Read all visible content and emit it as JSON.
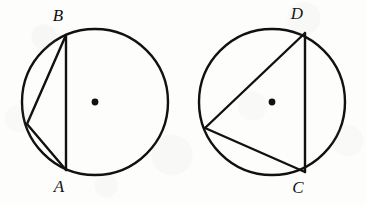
{
  "figure": {
    "type": "geometry-diagram",
    "canvas": {
      "width": 366,
      "height": 204
    },
    "colors": {
      "ink": "#111111",
      "paper": "#fdfdfc"
    },
    "stroke": {
      "circle_width": 2.4,
      "chord_width": 2.4,
      "center_dot_radius": 3.4
    },
    "shapes": [
      {
        "name": "left-circle-figure",
        "circle": {
          "cx": 95,
          "cy": 102,
          "r": 73
        },
        "center_dot": {
          "cx": 95,
          "cy": 102
        },
        "triangle": {
          "vertices": [
            {
              "label": "B",
              "x": 66,
              "y": 35,
              "label_x": 58,
              "label_y": 21
            },
            {
              "label": "A",
              "x": 66,
              "y": 170,
              "label_x": 59,
              "label_y": 192
            },
            {
              "label": "",
              "x": 27,
              "y": 124,
              "label_x": 0,
              "label_y": 0
            }
          ]
        }
      },
      {
        "name": "right-circle-figure",
        "circle": {
          "cx": 272,
          "cy": 102,
          "r": 73
        },
        "center_dot": {
          "cx": 272,
          "cy": 102
        },
        "triangle": {
          "vertices": [
            {
              "label": "D",
              "x": 305,
              "y": 33,
              "label_x": 297,
              "label_y": 19
            },
            {
              "label": "C",
              "x": 305,
              "y": 172,
              "label_x": 298,
              "label_y": 193
            },
            {
              "label": "",
              "x": 205,
              "y": 128,
              "label_x": 0,
              "label_y": 0
            }
          ]
        }
      }
    ],
    "labels": {
      "b": "B",
      "a": "A",
      "d": "D",
      "c": "C"
    }
  }
}
